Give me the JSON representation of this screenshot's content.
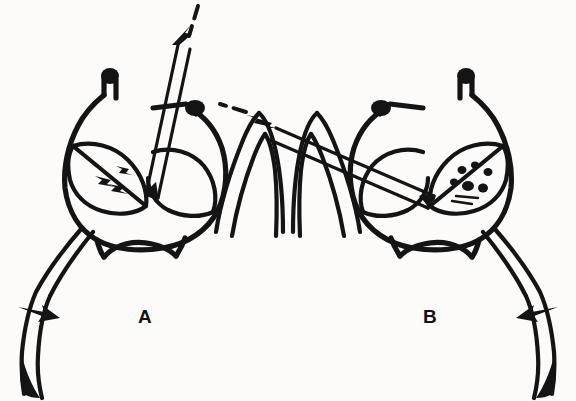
{
  "figure": {
    "type": "line-drawing",
    "style": "black-and-white scientific illustration",
    "background_color": "#fcfbfa",
    "ink_color": "#141414",
    "width": 576,
    "height": 401,
    "panel_count": 2
  },
  "panels": [
    {
      "id": "A",
      "label": "A",
      "label_position": {
        "x": 138,
        "y": 307
      },
      "side": "left",
      "orientation": "normal",
      "probe": {
        "name": "needle-probe",
        "angle_description": "steep, entering from upper right toward lower left",
        "entry_point_description": "top of body between the two knobbed projections",
        "tip_location_description": "inside the left lobe"
      },
      "trajectory_arrow": {
        "name": "dashed-trajectory-arrow",
        "direction": "down-left",
        "style": "dashed with solid arrowhead"
      },
      "pointer_arrow": {
        "name": "solid-pointer-arrow",
        "direction": "right",
        "position": {
          "x": 30,
          "y": 315
        },
        "points_to": "left appendage"
      },
      "internal_marks": {
        "name": "lobe-arrowheads",
        "count": 3,
        "description": "small solid arrowheads inside the left lobe"
      },
      "body": {
        "name": "bilobed-body",
        "lobes": 2,
        "projections": 2,
        "projection_style": "knob-tipped"
      },
      "appendages": [
        {
          "name": "appendage-left",
          "shape": "long tapering curve, descending to lower left"
        },
        {
          "name": "appendage-right",
          "shape": "inverted-V bent limb"
        }
      ]
    },
    {
      "id": "B",
      "label": "B",
      "label_position": {
        "x": 423,
        "y": 307
      },
      "side": "right",
      "orientation": "mirrored",
      "probe": {
        "name": "needle-probe",
        "angle_description": "shallow, near-horizontal entering from the right",
        "entry_point_description": "right flank of the body",
        "tip_location_description": "inside the left lobe"
      },
      "trajectory_arrow": {
        "name": "dashed-trajectory-arrow",
        "direction": "left",
        "style": "dashed with solid arrowhead"
      },
      "pointer_arrow": {
        "name": "solid-pointer-arrow",
        "direction": "left",
        "position": {
          "x": 546,
          "y": 315
        },
        "points_to": "right appendage"
      },
      "internal_marks": {
        "name": "lobe-stipple",
        "count": 8,
        "description": "stippled speckles and short strokes inside the left lobe"
      },
      "body": {
        "name": "bilobed-body",
        "lobes": 2,
        "projections": 2,
        "projection_style": "knob-tipped"
      },
      "appendages": [
        {
          "name": "appendage-left",
          "shape": "inverted-V bent limb"
        },
        {
          "name": "appendage-right",
          "shape": "long tapering curve, descending to lower right"
        }
      ]
    }
  ]
}
